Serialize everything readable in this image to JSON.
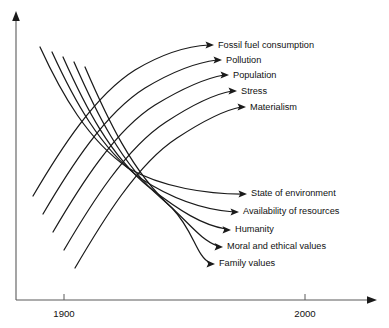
{
  "figure": {
    "background_color": "#ffffff",
    "line_color": "#1a1a1a",
    "axis_color": "#5a5a5a"
  },
  "axes": {
    "x_ticks": [
      {
        "label": "1900",
        "x": 64
      },
      {
        "label": "2000",
        "x": 305
      }
    ],
    "x_axis_arrow_name": "x-axis-arrow",
    "y_axis_arrow_name": "y-axis-arrow"
  },
  "chart_data": {
    "type": "line",
    "title": "",
    "xlabel": "",
    "ylabel": "",
    "grid": false,
    "legend": "none",
    "x_tick_labels": [
      "1900",
      "2000"
    ],
    "annotations": [
      "Fossil fuel consumption",
      "Pollution",
      "Population",
      "Stress",
      "Materialism",
      "State of environment",
      "Availability of resources",
      "Humanity",
      "Moral and ethical values",
      "Family values"
    ],
    "series": [
      {
        "name": "Fossil fuel consumption",
        "direction": "rising",
        "label_x": 218,
        "label_y": 46
      },
      {
        "name": "Pollution",
        "direction": "rising",
        "label_x": 226,
        "label_y": 61
      },
      {
        "name": "Population",
        "direction": "rising",
        "label_x": 233,
        "label_y": 76
      },
      {
        "name": "Stress",
        "direction": "rising",
        "label_x": 241,
        "label_y": 92
      },
      {
        "name": "Materialism",
        "direction": "rising",
        "label_x": 250,
        "label_y": 108
      },
      {
        "name": "State of environment",
        "direction": "falling",
        "label_x": 251,
        "label_y": 194
      },
      {
        "name": "Availability of resources",
        "direction": "falling",
        "label_x": 243,
        "label_y": 212
      },
      {
        "name": "Humanity",
        "direction": "falling",
        "label_x": 235,
        "label_y": 230
      },
      {
        "name": "Moral and ethical values",
        "direction": "falling",
        "label_x": 227,
        "label_y": 247
      },
      {
        "name": "Family values",
        "direction": "falling",
        "label_x": 219,
        "label_y": 264
      }
    ]
  },
  "curves": {
    "rising": [
      {
        "name": "fossil-fuel-consumption",
        "path": "M 33 196 C 60 150 95 95 135 70 C 165 52 190 46 209 45"
      },
      {
        "name": "pollution",
        "path": "M 43 214 C 70 168 105 113 145 88 C 175 70 200 62 217 60"
      },
      {
        "name": "population",
        "path": "M 53 232 C 80 186 115 130 155 105 C 183 88 207 78 224 75"
      },
      {
        "name": "stress",
        "path": "M 64 250 C 91 204 126 148 166 122 C 192 105 215 94 232 91"
      },
      {
        "name": "materialism",
        "path": "M 75 268 C 102 222 137 164 177 138 C 203 121 225 110 241 107"
      }
    ],
    "falling": [
      {
        "name": "state-of-environment",
        "path": "M 40 47 C 62 95 88 140 128 168 C 163 188 208 194 242 194"
      },
      {
        "name": "availability-of-resources",
        "path": "M 52 52 C 74 100 100 148 140 178 C 172 199 205 210 234 212"
      },
      {
        "name": "humanity",
        "path": "M 63 57 C 85 106 110 156 150 188 C 180 211 202 225 226 229"
      },
      {
        "name": "moral-and-ethical-values",
        "path": "M 74 62 C 96 112 121 164 161 198 C 188 221 200 240 218 246"
      },
      {
        "name": "family-values",
        "path": "M 85 67 C 107 118 132 172 172 208 C 194 231 196 256 210 263"
      }
    ]
  }
}
